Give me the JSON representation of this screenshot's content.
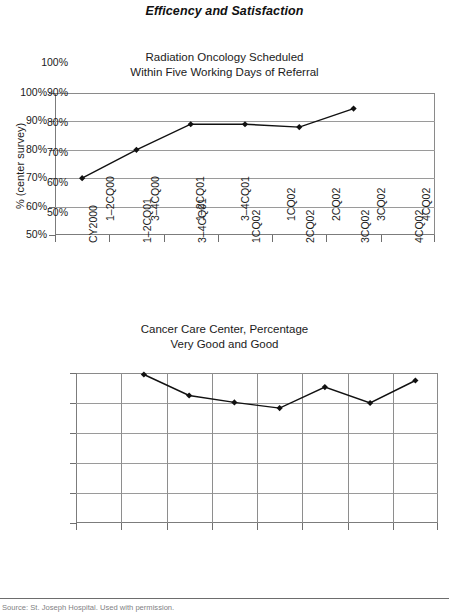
{
  "page": {
    "heading": "Efficency and Satisfaction",
    "footer_note": "Source: St. Joseph Hospital. Used with permission.",
    "line_color": "#111111",
    "grid_color": "#9a9a9a",
    "axis_color": "#7c7c7c"
  },
  "chart_data": [
    {
      "type": "line",
      "title": "Radiation Oncology Scheduled\nWithin Five Working Days of Referral",
      "xlabel": "",
      "ylabel": "",
      "categories": [
        "CY2000",
        "1–2CQ01",
        "3–4CQ01",
        "1CQ02",
        "2CQ02",
        "3CQ02",
        "4CQ02"
      ],
      "values": [
        70,
        80,
        89,
        89,
        88,
        94.5,
        null
      ],
      "ylim": [
        50,
        100
      ],
      "yticks": [
        100,
        90,
        80,
        70,
        60,
        50
      ],
      "ytick_labels": [
        "100%",
        "90%",
        "80%",
        "70%",
        "60%",
        "50%"
      ],
      "grid": "horizontal",
      "legend": "none",
      "marker": "diamond"
    },
    {
      "type": "line",
      "title": "Cancer Care Center, Percentage\nVery Good and Good",
      "xlabel": "",
      "ylabel": "% (center survey)",
      "categories": [
        "1–2CQ00",
        "3–4CQ00",
        "1–2CQ01",
        "3–4CQ01",
        "1CQ02",
        "2CQ02",
        "3CQ02",
        "4CQ02"
      ],
      "values": [
        null,
        99.5,
        92.5,
        90.2,
        88.3,
        95.3,
        90.0,
        97.5
      ],
      "ylim": [
        50,
        100
      ],
      "yticks": [
        100,
        90,
        80,
        70,
        60,
        50
      ],
      "ytick_labels": [
        "100%",
        "90%",
        "80%",
        "70%",
        "60%",
        "50%"
      ],
      "grid": "both",
      "legend": "none",
      "marker": "diamond"
    }
  ]
}
